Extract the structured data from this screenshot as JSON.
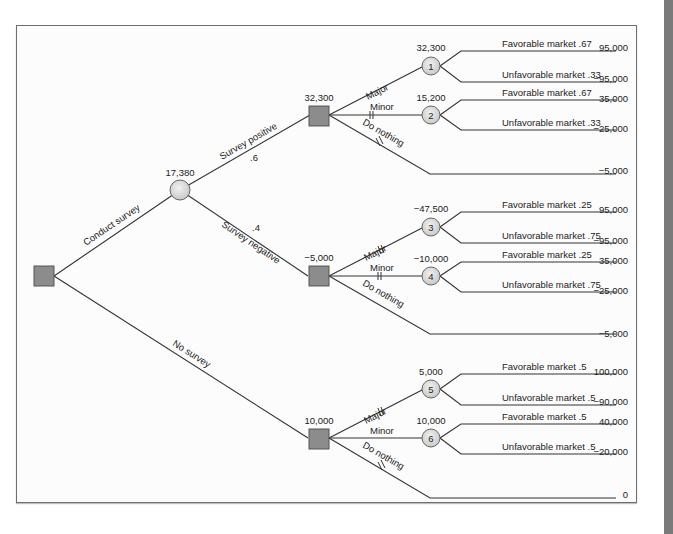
{
  "colors": {
    "line": "#333333",
    "decision_fill": "#8c8c8c",
    "chance_fill": "#d9d9d9",
    "frame": "#6e6e6e"
  },
  "root": {
    "branches": {
      "conduct_survey": "Conduct survey",
      "no_survey": "No survey"
    }
  },
  "survey_chance": {
    "value": "17,380",
    "branches": {
      "positive": "Survey positive",
      "positive_prob": ".6",
      "negative": "Survey negative",
      "negative_prob": ".4"
    }
  },
  "decisions": [
    {
      "value": "32,300",
      "options": {
        "major": "Major",
        "minor": "Minor",
        "nothing": "Do nothing"
      },
      "nothing_payoff": "−5,000"
    },
    {
      "value": "−5,000",
      "options": {
        "major": "Major",
        "minor": "Minor",
        "nothing": "Do nothing"
      },
      "nothing_payoff": "−5,000"
    },
    {
      "value": "10,000",
      "options": {
        "major": "Major",
        "minor": "Minor",
        "nothing": "Do nothing"
      },
      "nothing_payoff": "0"
    }
  ],
  "chance_nodes": [
    {
      "id": "1",
      "value": "32,300",
      "fav_label": "Favorable market .67",
      "unfav_label": "Unfavorable market .33",
      "fav_payoff": "95,000",
      "unfav_payoff": "−95,000"
    },
    {
      "id": "2",
      "value": "15,200",
      "fav_label": "Favorable market .67",
      "unfav_label": "Unfavorable market .33",
      "fav_payoff": "35,000",
      "unfav_payoff": "−25,000"
    },
    {
      "id": "3",
      "value": "−47,500",
      "fav_label": "Favorable market .25",
      "unfav_label": "Unfavorable market .75",
      "fav_payoff": "95,000",
      "unfav_payoff": "−95,000"
    },
    {
      "id": "4",
      "value": "−10,000",
      "fav_label": "Favorable market .25",
      "unfav_label": "Unfavorable market .75",
      "fav_payoff": "35,000",
      "unfav_payoff": "−25,000"
    },
    {
      "id": "5",
      "value": "5,000",
      "fav_label": "Favorable market .5",
      "unfav_label": "Unfavorable market .5",
      "fav_payoff": "100,000",
      "unfav_payoff": "−90,000"
    },
    {
      "id": "6",
      "value": "10,000",
      "fav_label": "Favorable market .5",
      "unfav_label": "Unfavorable market .5",
      "fav_payoff": "40,000",
      "unfav_payoff": "−20,000"
    }
  ]
}
